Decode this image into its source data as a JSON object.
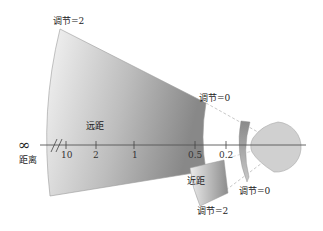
{
  "diagram": {
    "title": "",
    "labels": {
      "far_top": "调节=2",
      "far_region": "远距",
      "far_right": "调节=0",
      "infinity_symbol": "∞",
      "distance": "距离",
      "near_region": "近距",
      "near_bottom": "调节=2",
      "lens_label": "调节=0"
    },
    "axis": {
      "ticks": [
        {
          "label": "10",
          "x": 66
        },
        {
          "label": "2",
          "x": 96
        },
        {
          "label": "1",
          "x": 134
        },
        {
          "label": "0.5",
          "x": 195
        },
        {
          "label": "0.2",
          "x": 226
        }
      ]
    },
    "colors": {
      "wedge_light": "#f2f2f2",
      "wedge_dark": "#8c8c8c",
      "near_light": "#e8e8e8",
      "near_dark": "#8a8a8a",
      "lens": "#a9a9a9",
      "eye": "#cfcfcf",
      "axis": "#555555",
      "dash": "#aaaaaa"
    }
  }
}
